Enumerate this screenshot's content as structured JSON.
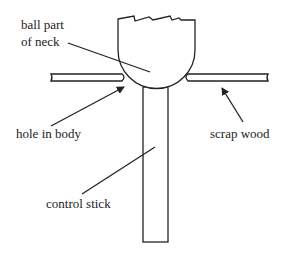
{
  "diagram": {
    "labels": {
      "ball_line1": "ball part",
      "ball_line2": "of neck",
      "hole": "hole in body",
      "scrap": "scrap wood",
      "stick": "control stick"
    },
    "parts": [
      "ball part of neck",
      "hole in body",
      "scrap wood",
      "control stick"
    ],
    "colors": {
      "stroke": "#222222",
      "background": "#ffffff"
    }
  }
}
